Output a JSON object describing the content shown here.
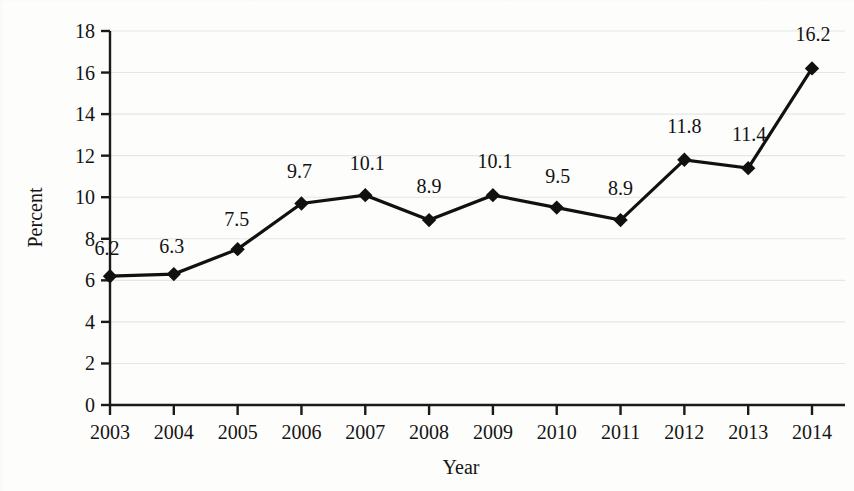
{
  "chart_data": {
    "type": "line",
    "title": "",
    "subtitle": "",
    "xlabel": "Year",
    "ylabel": "Percent",
    "categories": [
      "2003",
      "2004",
      "2005",
      "2006",
      "2007",
      "2008",
      "2009",
      "2010",
      "2011",
      "2012",
      "2013",
      "2014"
    ],
    "values": [
      6.2,
      6.3,
      7.5,
      9.7,
      10.1,
      8.9,
      10.1,
      9.5,
      8.9,
      11.8,
      11.4,
      16.2
    ],
    "data_labels": [
      "6.2",
      "6.3",
      "7.5",
      "9.7",
      "10.1",
      "8.9",
      "10.1",
      "9.5",
      "8.9",
      "11.8",
      "11.4",
      "16.2"
    ],
    "ylim": [
      0,
      18
    ],
    "ytick_labels": [
      "0",
      "2",
      "4",
      "6",
      "8",
      "10",
      "12",
      "14",
      "16",
      "18"
    ],
    "ytick_values": [
      0,
      2,
      4,
      6,
      8,
      10,
      12,
      14,
      16,
      18
    ],
    "grid": true,
    "grid_axis": "y",
    "legend": "none",
    "series": [
      {
        "name": "Percent",
        "marker": "diamond",
        "marker_color": "#111111",
        "line_color": "#111111",
        "values": [
          6.2,
          6.3,
          7.5,
          9.7,
          10.1,
          8.9,
          10.1,
          9.5,
          8.9,
          11.8,
          11.4,
          16.2
        ]
      }
    ]
  },
  "style": {
    "background": "#fdfdfc",
    "axis_color": "#1a1a1a",
    "grid_color": "#e6e6e6",
    "text_color": "#141414"
  }
}
